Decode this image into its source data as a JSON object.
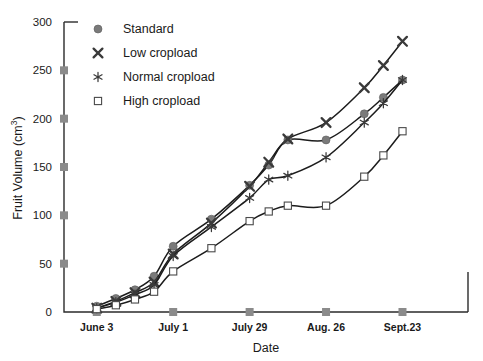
{
  "chart_data": {
    "type": "line",
    "title": "",
    "xlabel": "Date",
    "ylabel": "Fruit Volume (cm3)",
    "ylabel_display": "Fruit Volume (cm",
    "ylabel_sup": "3",
    "ylabel_tail": ")",
    "grid": false,
    "legend_position": "top-left",
    "ylim": [
      0,
      300
    ],
    "yticks": [
      0,
      50,
      100,
      150,
      200,
      250,
      300
    ],
    "ytick_labels": [
      "0",
      "50",
      "100",
      "150",
      "200",
      "250",
      "300"
    ],
    "xtick_labels": [
      "June 3",
      "July 1",
      "July 29",
      "Aug. 26",
      "Sept.23"
    ],
    "xtick_days": [
      0,
      28,
      56,
      84,
      112
    ],
    "xlim_days": [
      -12,
      136
    ],
    "x": [
      0,
      7,
      14,
      21,
      28,
      42,
      56,
      63,
      70,
      84,
      98,
      105,
      112
    ],
    "series": [
      {
        "name": "Standard",
        "marker": "filled-circle",
        "values": [
          6,
          14,
          23,
          37,
          68,
          96,
          131,
          152,
          178,
          178,
          205,
          222,
          240
        ]
      },
      {
        "name": "Low cropload",
        "marker": "heavy-x",
        "values": [
          4,
          11,
          20,
          31,
          60,
          92,
          130,
          155,
          179,
          196,
          232,
          255,
          280
        ]
      },
      {
        "name": "Normal cropload",
        "marker": "asterisk",
        "values": [
          4,
          10,
          18,
          28,
          58,
          88,
          118,
          137,
          141,
          160,
          196,
          216,
          240
        ]
      },
      {
        "name": "High cropload",
        "marker": "open-square",
        "values": [
          3,
          7,
          13,
          21,
          42,
          66,
          94,
          104,
          110,
          110,
          140,
          162,
          187
        ]
      }
    ]
  },
  "legend": {
    "items": [
      {
        "label": "Standard",
        "marker": "filled-circle"
      },
      {
        "label": "Low cropload",
        "marker": "heavy-x"
      },
      {
        "label": "Normal cropload",
        "marker": "asterisk"
      },
      {
        "label": "High cropload",
        "marker": "open-square"
      }
    ]
  },
  "colors": {
    "line": "#1c1c1c",
    "axis": "#2b2b2b",
    "tick_square": "#8b8b8b",
    "marker_fill": "#7a7a7a",
    "background": "#ffffff"
  }
}
